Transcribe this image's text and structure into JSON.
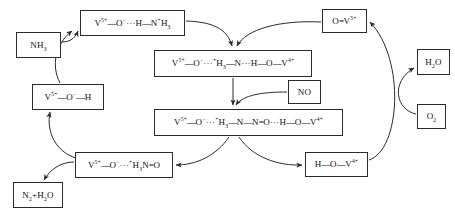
{
  "diagram": {
    "background_color": "#ffffff",
    "line_color": "#2b2b2b",
    "text_color": "#101010",
    "nodes": [
      {
        "id": "nh3",
        "name": "reactant-ammonia",
        "label": "NH₃",
        "html": "NH<sub>3</sub>",
        "x": 16,
        "y": 32,
        "w": 45,
        "h": 26,
        "font": 9
      },
      {
        "id": "ammonia-adsorbed",
        "name": "intermediate-ammonium-adsorbed",
        "label": "V⁵⁺—O⁻···H—N⁺H₃",
        "html": "V<sup>5+</sup><span class=\"bond\">—</span>O<sup>−</sup>···H<span class=\"bond\">—</span>N<sup>+</sup>H<sub>3</sub>",
        "x": 80,
        "y": 10,
        "w": 105,
        "h": 26,
        "font": 9
      },
      {
        "id": "vanadol",
        "name": "intermediate-vanadium-hydroxyl",
        "label": "V⁵⁺—O⁻—H",
        "html": "V<sup>5+</sup><span class=\"bond\">—</span>O<sup>−</sup><span class=\"bond\">—</span>H",
        "x": 32,
        "y": 84,
        "w": 72,
        "h": 26,
        "font": 9
      },
      {
        "id": "nitrosamine-like",
        "name": "intermediate-nitrosamine-precursor",
        "label": "V⁵⁺—O⁻···⁺H₃N=O",
        "html": "V<sup>5+</sup><span class=\"bond\">—</span>O<sup>−</sup>···<sup>+</sup>H<sub>3</sub>N<span class=\"bond\">=</span>O",
        "x": 75,
        "y": 152,
        "w": 98,
        "h": 26,
        "font": 9
      },
      {
        "id": "products",
        "name": "product-nitrogen-water",
        "label": "N₂+H₂O",
        "html": "N<sub>2</sub>+H<sub>2</sub>O",
        "x": 13,
        "y": 182,
        "w": 50,
        "h": 26,
        "font": 9
      },
      {
        "id": "dual-site-complex",
        "name": "intermediate-dual-site-ammonium-complex",
        "label": "V⁵⁺—O⁻···⁺H₃—N···H—O—V⁴⁺",
        "html": "V<sup>5+</sup><span class=\"bond\">—</span>O<sup>−</sup>···<sup>+</sup>H<sub>3</sub><span class=\"bond\">—</span>N···H<span class=\"bond\">—</span>O<span class=\"bond\">—</span>V<sup>4+</sup>",
        "x": 154,
        "y": 50,
        "w": 158,
        "h": 27,
        "font": 9
      },
      {
        "id": "nitrosamide-complex",
        "name": "intermediate-nitrosamide-complex",
        "label": "V⁵⁺—O⁻···⁺H₃—N—N=O···H—O—V⁴⁺",
        "html": "V<sup>5+</sup><span class=\"bond\">—</span>O<sup>−</sup>···<sup>+</sup>H<sub>3</sub><span class=\"bond\">—</span>N<span class=\"bond\">—</span>N<span class=\"bond\">=</span>O···H<span class=\"bond\">—</span>O<span class=\"bond\">—</span>V<sup>4+</sup>",
        "x": 154,
        "y": 109,
        "w": 189,
        "h": 27,
        "font": 9
      },
      {
        "id": "no",
        "name": "reactant-nitric-oxide",
        "label": "NO",
        "html": "NO",
        "x": 288,
        "y": 80,
        "w": 33,
        "h": 24,
        "font": 9
      },
      {
        "id": "vanadyl",
        "name": "intermediate-vanadyl-oxo",
        "label": "O=V⁵⁺",
        "html": "O<span class=\"bond\">=</span>V<sup>5+</sup>",
        "x": 322,
        "y": 9,
        "w": 45,
        "h": 24,
        "font": 9
      },
      {
        "id": "reduced-site",
        "name": "intermediate-reduced-vanadium-hydroxyl",
        "label": "H—O—V⁴⁺",
        "html": "H<span class=\"bond\">—</span>O<span class=\"bond\">—</span>V<sup>4+</sup>",
        "x": 305,
        "y": 152,
        "w": 63,
        "h": 25,
        "font": 9
      },
      {
        "id": "h2o",
        "name": "product-water",
        "label": "H₂O",
        "html": "H<sub>2</sub>O",
        "x": 417,
        "y": 49,
        "w": 33,
        "h": 26,
        "font": 9
      },
      {
        "id": "o2",
        "name": "reactant-oxygen",
        "label": "O₂",
        "html": "O<sub>2</sub>",
        "x": 417,
        "y": 104,
        "w": 29,
        "h": 25,
        "font": 9
      }
    ],
    "arrows": [
      {
        "id": "a1",
        "name": "arrow-ammonia-to-adsorbed",
        "from": "nh3",
        "to": "ammonia-adsorbed",
        "path": "M 62,42 C 72,42 76,36 78,31"
      },
      {
        "id": "a2",
        "name": "arrow-hydroxyl-to-adsorbed",
        "from": "vanadol",
        "to": "ammonia-adsorbed",
        "path": "M 60,83 C 51,66 55,44 72,31"
      },
      {
        "id": "a3",
        "name": "arrow-adsorbed-to-dual-site",
        "from": "ammonia-adsorbed",
        "to": "dual-site-complex",
        "path": "M 186,21 C 218,22 228,32 232,46"
      },
      {
        "id": "a4",
        "name": "arrow-vanadyl-to-dual-site",
        "from": "vanadyl",
        "to": "dual-site-complex",
        "path": "M 321,22 C 280,20 246,29 237,46"
      },
      {
        "id": "a5",
        "name": "arrow-dual-site-to-nitrosamide",
        "from": "dual-site-complex",
        "to": "nitrosamide-complex",
        "path": "M 233,78 L 233,105"
      },
      {
        "id": "a6",
        "name": "arrow-no-to-nitrosamide",
        "from": "no",
        "to": "nitrosamide-complex",
        "path": "M 287,92 C 262,92 243,95 236,105"
      },
      {
        "id": "a7",
        "name": "arrow-nitrosamide-to-nitrosamine",
        "from": "nitrosamide-complex",
        "to": "nitrosamine-like",
        "path": "M 229,137 C 216,156 196,165 176,165"
      },
      {
        "id": "a8",
        "name": "arrow-nitrosamide-to-reduced",
        "from": "nitrosamide-complex",
        "to": "reduced-site",
        "path": "M 239,137 C 252,157 278,166 302,165"
      },
      {
        "id": "a9",
        "name": "arrow-nitrosamine-to-products",
        "from": "nitrosamine-like",
        "to": "products",
        "path": "M 74,162 C 60,162 50,170 44,180"
      },
      {
        "id": "a10",
        "name": "arrow-nitrosamine-to-hydroxyl",
        "from": "nitrosamine-like",
        "to": "vanadol",
        "path": "M 76,158 C 56,152 46,132 50,112"
      },
      {
        "id": "a11",
        "name": "arrow-reduced-to-vanadyl",
        "from": "reduced-site",
        "to": "vanadyl",
        "path": "M 369,160 C 400,150 406,60 370,22"
      },
      {
        "id": "a12",
        "name": "arrow-oxygen-to-water",
        "from": "o2",
        "to": "h2o",
        "path": "M 416,114 C 396,110 390,82 414,68"
      }
    ]
  }
}
